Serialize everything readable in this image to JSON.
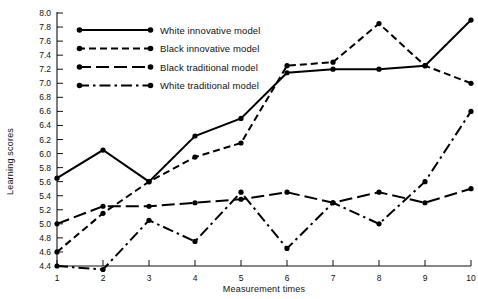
{
  "chart_data": {
    "type": "line",
    "title": "",
    "xlabel": "Measurement times",
    "ylabel": "Learning scores",
    "x": [
      1,
      2,
      3,
      4,
      5,
      6,
      7,
      8,
      9,
      10
    ],
    "xlim": [
      1,
      10
    ],
    "ylim": [
      4.4,
      8.0
    ],
    "ytick_step": 0.2,
    "grid": false,
    "legend_position": "top-center-inside",
    "xticklabels": [
      "1",
      "2",
      "3",
      "4",
      "5",
      "6",
      "7",
      "8",
      "9",
      "10"
    ],
    "yticklabels": [
      "4.4",
      "4.6",
      "4.8",
      "5.0",
      "5.2",
      "5.4",
      "5.6",
      "5.8",
      "6.0",
      "6.2",
      "6.4",
      "6.6",
      "6.8",
      "7.0",
      "7.2",
      "7.4",
      "7.6",
      "7.8",
      "8.0"
    ],
    "series": [
      {
        "name": "White innovative model",
        "style": "solid",
        "color": "#000000",
        "values": [
          5.65,
          6.05,
          5.6,
          6.25,
          6.5,
          7.15,
          7.2,
          7.2,
          7.25,
          7.9
        ]
      },
      {
        "name": "Black innovative model",
        "style": "dashed",
        "color": "#000000",
        "values": [
          4.6,
          5.15,
          5.6,
          5.95,
          6.15,
          7.25,
          7.3,
          7.85,
          7.25,
          7.0
        ]
      },
      {
        "name": "Black traditional model",
        "style": "long-dash",
        "color": "#000000",
        "values": [
          5.0,
          5.25,
          5.25,
          5.3,
          5.35,
          5.45,
          5.3,
          5.45,
          5.3,
          5.5
        ]
      },
      {
        "name": "White traditional model",
        "style": "dash-dot",
        "color": "#000000",
        "values": [
          4.4,
          4.35,
          5.05,
          4.75,
          5.45,
          4.65,
          5.3,
          5.0,
          5.6,
          6.6
        ]
      }
    ],
    "legend": [
      {
        "label": "White innovative model",
        "style": "solid"
      },
      {
        "label": "Black innovative model",
        "style": "dashed"
      },
      {
        "label": "Black traditional model",
        "style": "long-dash"
      },
      {
        "label": "White traditional model",
        "style": "dash-dot"
      }
    ]
  }
}
